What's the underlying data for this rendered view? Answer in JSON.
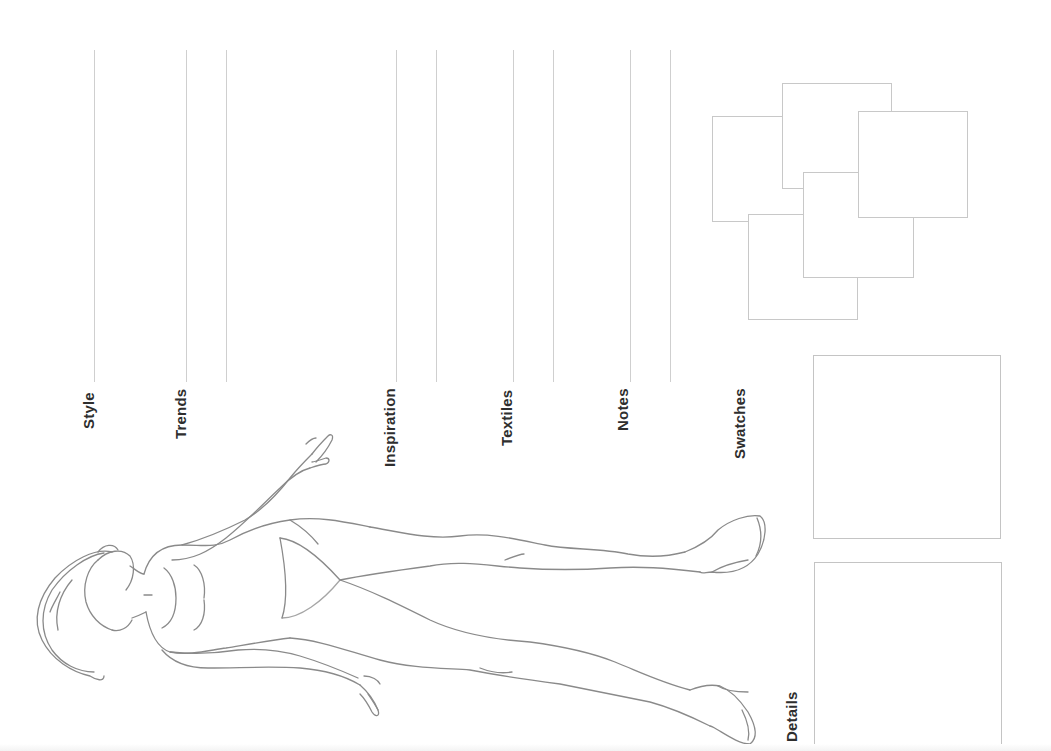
{
  "template": {
    "title": "Fashion Design Croquis Sheet",
    "labels": {
      "style": "Style",
      "trends": "Trends",
      "inspiration": "Inspiration",
      "textiles": "Textiles",
      "notes": "Notes",
      "swatches": "Swatches",
      "details": "Details"
    },
    "line_color": "#cfcfcf",
    "text_color": "#2e2e2e",
    "figure_stroke": "#8a8a8a",
    "swatch_count": 5,
    "detail_box_count": 2
  }
}
